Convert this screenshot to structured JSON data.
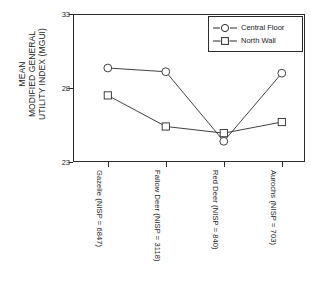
{
  "chart_data": {
    "type": "line",
    "title": "",
    "xlabel": "",
    "ylabel_lines": [
      "MEAN",
      "MODIFIED GENERAL",
      "UTILITY INDEX (MGUI)"
    ],
    "ylabel": "MEAN MODIFIED GENERAL UTILITY INDEX (MGUI)",
    "categories": [
      "Gazelle (NISP = 6847)",
      "Fallow Deer (NISP = 3118)",
      "Red Deer (NISP = 840)",
      "Aurochs (NISP = 703)"
    ],
    "ylim": [
      23,
      33
    ],
    "yticks": [
      23,
      28,
      33
    ],
    "ytick_labels": [
      "23",
      "28",
      "33"
    ],
    "grid": false,
    "legend_position": "top-right",
    "series": [
      {
        "name": "Central Floor",
        "marker": "circle",
        "color": "#2b2b2b",
        "values": [
          29.35,
          29.1,
          24.4,
          29.0
        ]
      },
      {
        "name": "North Wall",
        "marker": "square",
        "color": "#2b2b2b",
        "values": [
          27.5,
          25.4,
          24.95,
          25.7
        ]
      }
    ]
  },
  "legend": {
    "entries": [
      {
        "label": "Central Floor",
        "marker": "circle"
      },
      {
        "label": "North Wall",
        "marker": "square"
      }
    ]
  },
  "colors": {
    "axis": "#2b2b2b",
    "series_central_floor": "#2b2b2b",
    "series_north_wall": "#2b2b2b",
    "background": "#ffffff"
  }
}
